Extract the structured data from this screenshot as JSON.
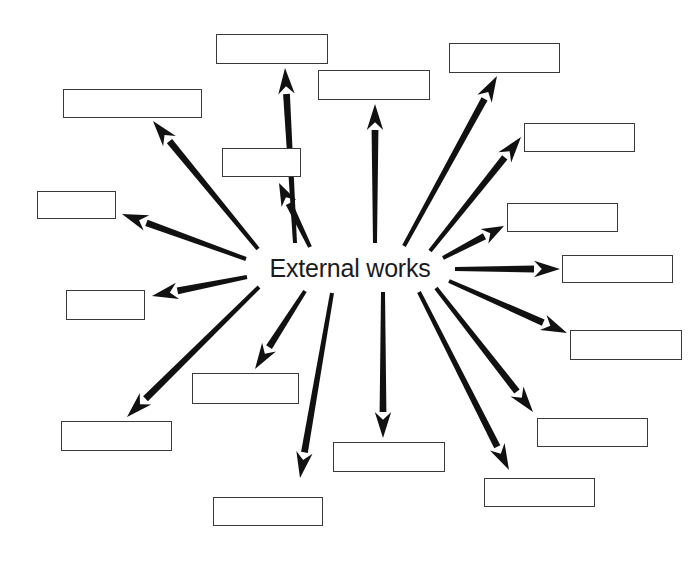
{
  "diagram": {
    "type": "radial-spider-diagram",
    "title": "External works",
    "center": {
      "label": "External works",
      "x": 350,
      "y": 268,
      "font_size": 25,
      "color": "#1b1b1b"
    },
    "style": {
      "background": "#ffffff",
      "arrow_color": "#111111",
      "arrow_stroke_width": 6,
      "box_border_color": "#3a3a3a",
      "box_fill": "#ffffff",
      "box_border_width": 1.6
    },
    "note": "All peripheral boxes are blank (unlabeled) in the source image.",
    "arrow_count": 18,
    "box_count": 18,
    "nodes": [
      {
        "id": "n01",
        "label": "",
        "x": 216,
        "y": 34,
        "w": 112,
        "h": 30,
        "tail": {
          "x": 295,
          "y": 243
        },
        "head": {
          "x": 285,
          "y": 68
        }
      },
      {
        "id": "n02",
        "label": "",
        "x": 318,
        "y": 70,
        "w": 112,
        "h": 30,
        "tail": {
          "x": 375,
          "y": 243
        },
        "head": {
          "x": 375,
          "y": 104
        }
      },
      {
        "id": "n03",
        "label": "",
        "x": 63,
        "y": 89,
        "w": 139,
        "h": 29,
        "tail": {
          "x": 258,
          "y": 249
        },
        "head": {
          "x": 153,
          "y": 121
        }
      },
      {
        "id": "n04",
        "label": "",
        "x": 449,
        "y": 43,
        "w": 111,
        "h": 30,
        "tail": {
          "x": 404,
          "y": 246
        },
        "head": {
          "x": 497,
          "y": 76
        }
      },
      {
        "id": "n05",
        "label": "",
        "x": 222,
        "y": 148,
        "w": 79,
        "h": 29,
        "tail": {
          "x": 310,
          "y": 247
        },
        "head": {
          "x": 279,
          "y": 183
        }
      },
      {
        "id": "n06",
        "label": "",
        "x": 524,
        "y": 123,
        "w": 111,
        "h": 29,
        "tail": {
          "x": 430,
          "y": 251
        },
        "head": {
          "x": 521,
          "y": 137
        }
      },
      {
        "id": "n07",
        "label": "",
        "x": 37,
        "y": 191,
        "w": 79,
        "h": 28,
        "tail": {
          "x": 246,
          "y": 259
        },
        "head": {
          "x": 122,
          "y": 214
        }
      },
      {
        "id": "n08",
        "label": "",
        "x": 507,
        "y": 203,
        "w": 111,
        "h": 29,
        "tail": {
          "x": 443,
          "y": 258
        },
        "head": {
          "x": 504,
          "y": 226
        }
      },
      {
        "id": "n09",
        "label": "",
        "x": 562,
        "y": 255,
        "w": 111,
        "h": 28,
        "tail": {
          "x": 455,
          "y": 269
        },
        "head": {
          "x": 560,
          "y": 269
        }
      },
      {
        "id": "n10",
        "label": "",
        "x": 66,
        "y": 290,
        "w": 79,
        "h": 30,
        "tail": {
          "x": 247,
          "y": 277
        },
        "head": {
          "x": 152,
          "y": 296
        }
      },
      {
        "id": "n11",
        "label": "",
        "x": 570,
        "y": 330,
        "w": 112,
        "h": 30,
        "tail": {
          "x": 449,
          "y": 281
        },
        "head": {
          "x": 567,
          "y": 333
        }
      },
      {
        "id": "n12",
        "label": "",
        "x": 192,
        "y": 373,
        "w": 107,
        "h": 31,
        "tail": {
          "x": 305,
          "y": 291
        },
        "head": {
          "x": 255,
          "y": 369
        }
      },
      {
        "id": "n13",
        "label": "",
        "x": 61,
        "y": 421,
        "w": 111,
        "h": 30,
        "tail": {
          "x": 259,
          "y": 287
        },
        "head": {
          "x": 127,
          "y": 417
        }
      },
      {
        "id": "n14",
        "label": "",
        "x": 537,
        "y": 418,
        "w": 111,
        "h": 29,
        "tail": {
          "x": 436,
          "y": 288
        },
        "head": {
          "x": 533,
          "y": 412
        }
      },
      {
        "id": "n15",
        "label": "",
        "x": 333,
        "y": 442,
        "w": 112,
        "h": 30,
        "tail": {
          "x": 383,
          "y": 292
        },
        "head": {
          "x": 383,
          "y": 438
        }
      },
      {
        "id": "n16",
        "label": "",
        "x": 213,
        "y": 497,
        "w": 110,
        "h": 29,
        "tail": {
          "x": 332,
          "y": 293
        },
        "head": {
          "x": 300,
          "y": 478
        }
      },
      {
        "id": "n17",
        "label": "",
        "x": 484,
        "y": 478,
        "w": 111,
        "h": 29,
        "tail": {
          "x": 419,
          "y": 292
        },
        "head": {
          "x": 509,
          "y": 470
        }
      },
      {
        "id": "n18",
        "label": "",
        "x": 0,
        "y": 0,
        "w": 0,
        "h": 0,
        "tail": {
          "x": 0,
          "y": 0
        },
        "head": {
          "x": 0,
          "y": 0
        },
        "hidden": true
      }
    ]
  }
}
